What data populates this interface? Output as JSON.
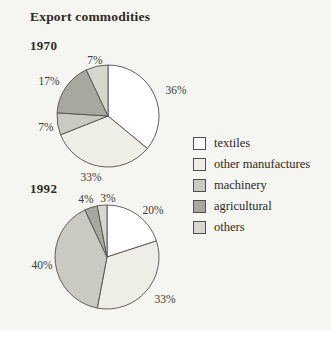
{
  "title": "Export commodities",
  "panel": {
    "background": "#f5f5f1",
    "outline_color": "#4f4f4f",
    "heading_color": "#2e2a24",
    "label_color": "#3a3a3a"
  },
  "legend": {
    "items": [
      {
        "label": "textiles",
        "color": "#ffffff"
      },
      {
        "label": "other manufactures",
        "color": "#efeee6"
      },
      {
        "label": "machinery",
        "color": "#cbcac2"
      },
      {
        "label": "agricultural",
        "color": "#a9a8a0"
      },
      {
        "label": "others",
        "color": "#d8d7cf"
      }
    ]
  },
  "chart_data": [
    {
      "type": "pie",
      "title": "1970",
      "categories": [
        "textiles",
        "other manufactures",
        "machinery",
        "agricultural",
        "others"
      ],
      "values": [
        36,
        33,
        7,
        17,
        7
      ],
      "unit": "%",
      "labels": [
        "36%",
        "33%",
        "7%",
        "17%",
        "7%"
      ],
      "start_angle_deg": 0,
      "direction": "clockwise",
      "legend_position": "right"
    },
    {
      "type": "pie",
      "title": "1992",
      "categories": [
        "textiles",
        "other manufactures",
        "machinery",
        "agricultural",
        "others"
      ],
      "values": [
        20,
        33,
        40,
        4,
        3
      ],
      "unit": "%",
      "labels": [
        "20%",
        "33%",
        "40%",
        "4%",
        "3%"
      ],
      "start_angle_deg": 0,
      "direction": "clockwise",
      "legend_position": "right"
    }
  ]
}
